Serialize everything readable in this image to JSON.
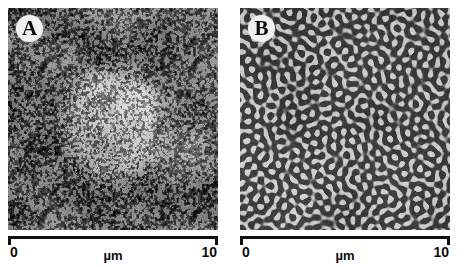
{
  "figure": {
    "type": "micrograph-pair",
    "background_color": "#ffffff"
  },
  "panels": [
    {
      "id": "A",
      "label": "A",
      "pattern": "droplet-speckle",
      "description": "Fine dark droplet speckle on gray background with brighter ordered central domain",
      "mean_gray": "#8e8e8e",
      "scalebar": {
        "min": "0",
        "max": "10",
        "unit": "µm",
        "length_um": 10
      }
    },
    {
      "id": "B",
      "label": "B",
      "pattern": "labyrinthine-bicontinuous",
      "description": "Interconnected worm-like dark channels in a light gray matrix (spinodal decomposition)",
      "mean_gray": "#b4b2ad",
      "scalebar": {
        "min": "0",
        "max": "10",
        "unit": "µm",
        "length_um": 10
      }
    }
  ],
  "colors": {
    "ink": "#111111",
    "label_disc": "#f2f1ee",
    "panel_a_base": "#8e8e8e",
    "panel_b_light": "#c9c7c1",
    "panel_b_dark": "#3a3a38"
  }
}
